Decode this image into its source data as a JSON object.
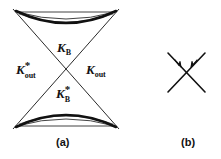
{
  "figure": {
    "background_color": "#ffffff",
    "stroke_color": "#111111",
    "width": 221,
    "height": 159,
    "panels": [
      {
        "id": "panel-a",
        "caption": "(a)",
        "description": "Two-sheeted hyperbola with crossing asymptotes",
        "center_x": 66,
        "center_y": 69,
        "labels": [
          {
            "id": "kb",
            "base": "K",
            "superscript": "",
            "subscript": "B",
            "x": 57,
            "y": 39
          },
          {
            "id": "kout-star",
            "base": "K",
            "superscript": "*",
            "subscript": "out",
            "x": 16,
            "y": 61
          },
          {
            "id": "kout",
            "base": "K",
            "superscript": "",
            "subscript": "out",
            "x": 86,
            "y": 61
          },
          {
            "id": "kb-star",
            "base": "K",
            "superscript": "*",
            "subscript": "B",
            "x": 56,
            "y": 85
          }
        ]
      },
      {
        "id": "panel-b",
        "caption": "(b)",
        "description": "Two crossing straight lines with inward arrowheads",
        "center_x": 186,
        "center_y": 72
      }
    ],
    "captions": {
      "a": "(a)",
      "b": "(b)"
    },
    "symbols": {
      "k": "K",
      "asterisk": "*",
      "sub_b": "B",
      "sub_out": "out"
    }
  }
}
